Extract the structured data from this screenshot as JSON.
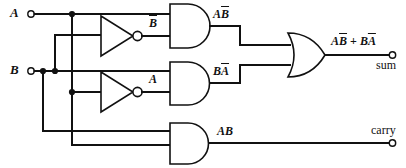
{
  "diagram": {
    "kind": "logic-gate-schematic",
    "line_color": "#111111",
    "background_color": "#ffffff"
  },
  "inputs": [
    {
      "id": "A",
      "label": "A",
      "terminal": "input-terminal"
    },
    {
      "id": "B",
      "label": "B",
      "terminal": "input-terminal"
    }
  ],
  "outputs": [
    {
      "id": "sum",
      "label": "sum",
      "expression_plain": "AB + BA",
      "terminal": "output-terminal"
    },
    {
      "id": "carry",
      "label": "carry",
      "expression_plain": "AB",
      "terminal": "output-terminal"
    }
  ],
  "gates": [
    {
      "id": "not-b",
      "type": "NOT",
      "output_signal": "B"
    },
    {
      "id": "not-a",
      "type": "NOT",
      "output_signal": "A"
    },
    {
      "id": "and-top",
      "type": "AND",
      "output_signal": "AB"
    },
    {
      "id": "and-middle",
      "type": "AND",
      "output_signal": "BA"
    },
    {
      "id": "and-bottom",
      "type": "AND",
      "output_signal": "AB"
    },
    {
      "id": "or-sum",
      "type": "OR",
      "output_signal": "AB + BA"
    }
  ],
  "labels": {
    "input_a": "A",
    "input_b": "B",
    "not_b_out_base": "B",
    "not_a_out_base": "A",
    "and_top_out_a": "A",
    "and_top_out_bbar": "B",
    "and_mid_out_b": "B",
    "and_mid_out_abar": "A",
    "and_bottom_out": "AB",
    "or_out_term1_a": "A",
    "or_out_term1_bbar": "B",
    "or_out_plus": " + ",
    "or_out_term2_b": "B",
    "or_out_term2_abar": "A",
    "sum_port": "sum",
    "carry_port": "carry"
  }
}
